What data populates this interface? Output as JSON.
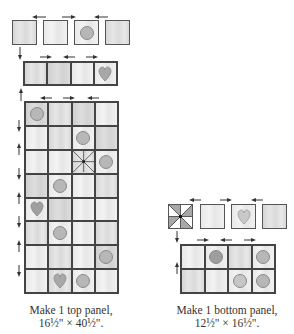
{
  "top_panel": {
    "caption_line1": "Make 1 top panel,",
    "caption_line2": "16½\" × 40½\".",
    "row1_units": [
      "plain",
      "plain",
      "circle",
      "plain"
    ],
    "row2_units": [
      "plain",
      "plain",
      "plain",
      "heart"
    ],
    "grid_rows": 8,
    "grid_cols": 4,
    "grid": [
      [
        "circle",
        "plain",
        "plain",
        "plain"
      ],
      [
        "plain",
        "plain",
        "circle",
        "plain"
      ],
      [
        "plain",
        "plain",
        "pinwheel",
        "circle"
      ],
      [
        "plain",
        "circle",
        "plain",
        "plain"
      ],
      [
        "heart",
        "plain",
        "plain",
        "plain"
      ],
      [
        "plain",
        "circle",
        "plain",
        "plain"
      ],
      [
        "plain",
        "plain",
        "plain",
        "circle"
      ],
      [
        "plain",
        "heart",
        "circle",
        "plain"
      ]
    ]
  },
  "bottom_panel": {
    "caption_line1": "Make 1 bottom panel,",
    "caption_line2": "12½\" × 16½\".",
    "row1_units": [
      "pinwheel",
      "plain",
      "heart",
      "plain"
    ],
    "grid_rows": 2,
    "grid_cols": 4,
    "grid": [
      [
        "plain",
        "circle",
        "plain",
        "circle"
      ],
      [
        "plain",
        "plain",
        "circle",
        "circle"
      ]
    ]
  },
  "arrows": {
    "pressing_direction_icon": "arrow-icon"
  }
}
